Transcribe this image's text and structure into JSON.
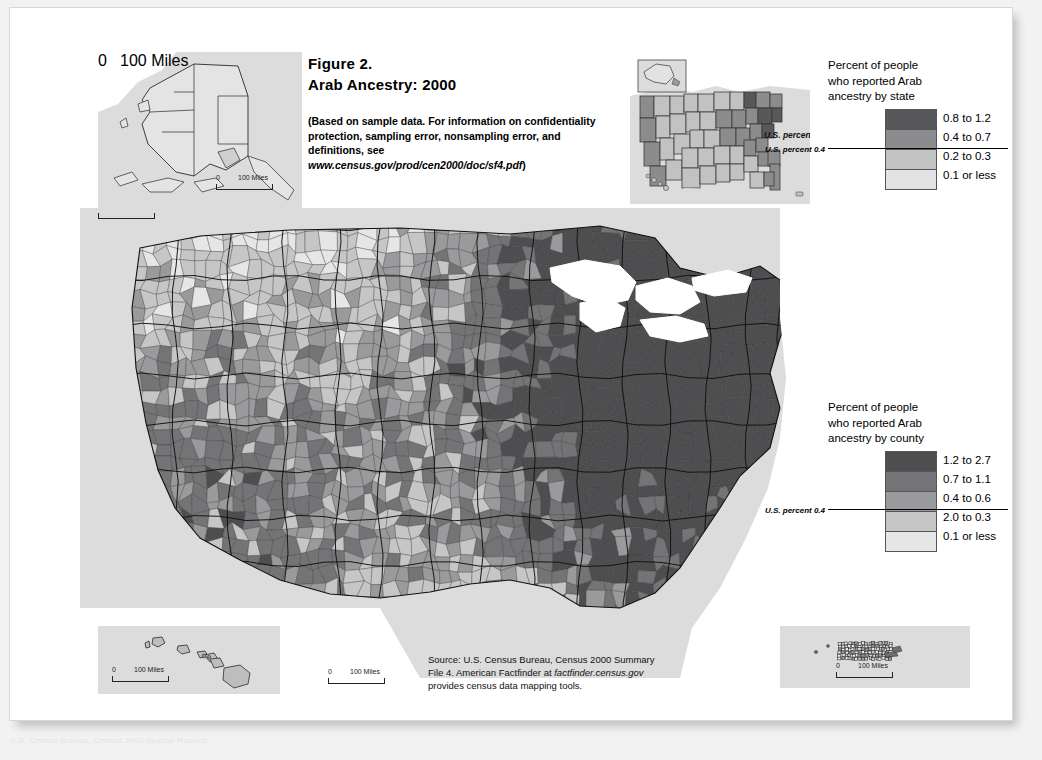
{
  "figure": {
    "number": "Figure 2.",
    "title": "Arab Ancestry: 2000",
    "blurb_prefix": "(Based on sample data. For information on confidentiality protection, sampling error, nonsampling error, and definitions, see ",
    "blurb_url": "www.census.gov/prod/cen2000/doc/sf4.pdf",
    "blurb_suffix": ")"
  },
  "source_note": {
    "line1": "Source: U.S. Census Bureau, Census 2000 Summary",
    "line2_prefix": "File 4. American Factfinder at ",
    "line2_url": "factfinder.census.gov",
    "line3": "provides census data mapping tools."
  },
  "footnote": "U.S. Census Bureau, Census 2000 Special Reports",
  "legend_state": {
    "title_line1": "Percent of people",
    "title_line2": "who reported Arab",
    "title_line3": "ancestry by state",
    "us_percent_label": "U.S. percent 0.4",
    "us_percent_value": 0.4,
    "classes": [
      {
        "label": "0.8 to 1.2",
        "color": "#58585a",
        "min": 0.8,
        "max": 1.2
      },
      {
        "label": "0.4 to 0.7",
        "color": "#8c8c8e",
        "min": 0.4,
        "max": 0.7
      },
      {
        "label": "0.2 to 0.3",
        "color": "#c2c2c3",
        "min": 0.2,
        "max": 0.3
      },
      {
        "label": "0.1 or less",
        "color": "#e3e3e3",
        "min": 0.0,
        "max": 0.1
      }
    ],
    "rule_after_index": 1
  },
  "legend_county": {
    "title_line1": "Percent of people",
    "title_line2": "who reported Arab",
    "title_line3": "ancestry by county",
    "us_percent_label": "U.S. percent 0.4",
    "us_percent_value": 0.4,
    "classes": [
      {
        "label": "1.2 to 2.7",
        "color": "#4e4e50",
        "min": 1.2,
        "max": 2.7
      },
      {
        "label": "0.7 to 1.1",
        "color": "#747476",
        "min": 0.7,
        "max": 1.1
      },
      {
        "label": "0.4 to 0.6",
        "color": "#9a9a9c",
        "min": 0.4,
        "max": 0.6
      },
      {
        "label": "2.0 to 0.3",
        "color": "#c6c6c7",
        "min": 0.2,
        "max": 0.3
      },
      {
        "label": "0.1 or less",
        "color": "#e6e6e6",
        "min": 0.0,
        "max": 0.1
      }
    ],
    "rule_after_index": 2
  },
  "scale_bars": {
    "alaska": {
      "zero": "0",
      "distance": "100 Miles"
    },
    "hawaii": {
      "zero": "0",
      "distance": "100 Miles"
    },
    "mainland": {
      "zero": "0",
      "distance": "100 Miles"
    },
    "puerto_rico": {
      "zero": "0",
      "distance": "100 Miles"
    }
  },
  "insets": {
    "alaska_name": "Alaska",
    "hawaii_name": "Hawaii",
    "puerto_rico_name": "Puerto Rico",
    "state_overview_name": "United States by state",
    "state_overview_us_percent_label": "U.S. percent"
  },
  "chart_data": {
    "type": "map",
    "map_kind": "choropleth",
    "title": "Arab Ancestry: 2000",
    "variable": "Percent of people who reported Arab ancestry",
    "units": "percent",
    "geography_levels": [
      "county",
      "state"
    ],
    "national_value": 0.4,
    "county_breaks": [
      0.1,
      0.3,
      0.6,
      1.1,
      2.7
    ],
    "state_breaks": [
      0.1,
      0.3,
      0.7,
      1.2
    ],
    "state_values": [
      {
        "state": "MI",
        "value": 1.2,
        "class": 0
      },
      {
        "state": "NJ",
        "value": 0.9,
        "class": 0
      },
      {
        "state": "MA",
        "value": 0.9,
        "class": 0
      },
      {
        "state": "NY",
        "value": 0.8,
        "class": 0
      },
      {
        "state": "RI",
        "value": 0.8,
        "class": 0
      },
      {
        "state": "CT",
        "value": 0.7,
        "class": 1
      },
      {
        "state": "NH",
        "value": 0.7,
        "class": 1
      },
      {
        "state": "ME",
        "value": 0.5,
        "class": 1
      },
      {
        "state": "VT",
        "value": 0.5,
        "class": 1
      },
      {
        "state": "PA",
        "value": 0.5,
        "class": 1
      },
      {
        "state": "OH",
        "value": 0.5,
        "class": 1
      },
      {
        "state": "VA",
        "value": 0.5,
        "class": 1
      },
      {
        "state": "MD",
        "value": 0.5,
        "class": 1
      },
      {
        "state": "DE",
        "value": 0.5,
        "class": 1
      },
      {
        "state": "FL",
        "value": 0.5,
        "class": 1
      },
      {
        "state": "CA",
        "value": 0.5,
        "class": 1
      },
      {
        "state": "IL",
        "value": 0.4,
        "class": 1
      },
      {
        "state": "WV",
        "value": 0.4,
        "class": 1
      },
      {
        "state": "TN",
        "value": 0.4,
        "class": 1
      },
      {
        "state": "AZ",
        "value": 0.4,
        "class": 1
      },
      {
        "state": "NV",
        "value": 0.4,
        "class": 1
      },
      {
        "state": "OR",
        "value": 0.3,
        "class": 2
      },
      {
        "state": "WA",
        "value": 0.3,
        "class": 2
      },
      {
        "state": "TX",
        "value": 0.3,
        "class": 2
      },
      {
        "state": "GA",
        "value": 0.3,
        "class": 2
      },
      {
        "state": "NC",
        "value": 0.3,
        "class": 2
      },
      {
        "state": "SC",
        "value": 0.3,
        "class": 2
      },
      {
        "state": "IN",
        "value": 0.3,
        "class": 2
      },
      {
        "state": "WI",
        "value": 0.3,
        "class": 2
      },
      {
        "state": "MN",
        "value": 0.3,
        "class": 2
      },
      {
        "state": "IA",
        "value": 0.3,
        "class": 2
      },
      {
        "state": "MO",
        "value": 0.3,
        "class": 2
      },
      {
        "state": "KS",
        "value": 0.3,
        "class": 2
      },
      {
        "state": "OK",
        "value": 0.3,
        "class": 2
      },
      {
        "state": "CO",
        "value": 0.3,
        "class": 2
      },
      {
        "state": "NM",
        "value": 0.2,
        "class": 2
      },
      {
        "state": "UT",
        "value": 0.2,
        "class": 2
      },
      {
        "state": "ID",
        "value": 0.2,
        "class": 2
      },
      {
        "state": "MT",
        "value": 0.2,
        "class": 2
      },
      {
        "state": "WY",
        "value": 0.2,
        "class": 2
      },
      {
        "state": "ND",
        "value": 0.2,
        "class": 2
      },
      {
        "state": "SD",
        "value": 0.2,
        "class": 2
      },
      {
        "state": "NE",
        "value": 0.2,
        "class": 2
      },
      {
        "state": "KY",
        "value": 0.2,
        "class": 2
      },
      {
        "state": "AL",
        "value": 0.2,
        "class": 2
      },
      {
        "state": "MS",
        "value": 0.2,
        "class": 2
      },
      {
        "state": "AR",
        "value": 0.2,
        "class": 2
      },
      {
        "state": "LA",
        "value": 0.2,
        "class": 2
      },
      {
        "state": "AK",
        "value": 0.1,
        "class": 3
      },
      {
        "state": "HI",
        "value": 0.1,
        "class": 3
      },
      {
        "state": "PR",
        "value": 0.1,
        "class": 3
      }
    ]
  }
}
